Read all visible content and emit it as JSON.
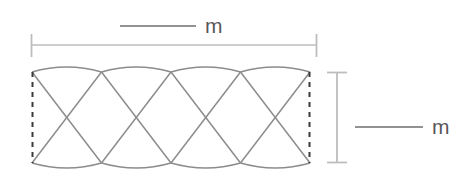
{
  "diagram": {
    "type": "scalloped-band-dimension-diagram",
    "background_color": "#ffffff",
    "colors": {
      "pattern_stroke": "#8c8c8e",
      "dimension_line": "#bdbdbf",
      "dashed_edge": "#3a3a3c",
      "label_line": "#6e6e70",
      "label_text": "#58585a"
    },
    "width_dimension": {
      "label": "m",
      "leader_line_visible": true,
      "extent_x": [
        31,
        317
      ],
      "line_y": 45,
      "tick_height": 22
    },
    "height_dimension": {
      "label": "m",
      "leader_line_visible": true,
      "bar_x": 337,
      "extent_y": [
        72,
        163
      ],
      "cap_width": 20
    },
    "pattern": {
      "left_x": 32,
      "right_x": 310,
      "top_y": 72,
      "bottom_y": 163,
      "arc_count": 4,
      "arc_bulge": 9,
      "cusps_x": [
        32,
        101.5,
        171,
        240.5,
        310
      ],
      "left_edge_style": "dashed",
      "right_edge_style": "dashed"
    }
  }
}
